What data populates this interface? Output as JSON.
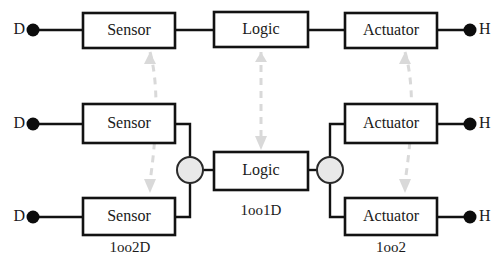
{
  "diagram": {
    "canvas": {
      "width": 503,
      "height": 275
    },
    "colors": {
      "box_stroke": "#121212",
      "box_fill": "#ffffff",
      "wire": "#121212",
      "terminal_dot": "#0c0c0c",
      "junction_fill": "#e8e8e8",
      "junction_stroke": "#2b2b2b",
      "ghost_arrow": "#d9d9d9",
      "text": "#1a1a1a",
      "background": "#ffffff"
    },
    "rows": [
      {
        "name": "top-chain",
        "blocks": [
          {
            "id": "sensor-top",
            "label": "Sensor",
            "x": 83,
            "y": 13,
            "w": 92,
            "h": 35
          },
          {
            "id": "logic-top",
            "label": "Logic",
            "x": 214,
            "y": 12,
            "w": 94,
            "h": 35
          },
          {
            "id": "actuator-top",
            "label": "Actuator",
            "x": 345,
            "y": 13,
            "w": 92,
            "h": 35
          }
        ],
        "terminals": [
          {
            "id": "terminal-d-top",
            "label": "D",
            "side": "left",
            "dot_x": 33,
            "dot_y": 30,
            "text_x": 24,
            "text_y": 30
          },
          {
            "id": "terminal-h-top",
            "label": "H",
            "side": "right",
            "dot_x": 470,
            "dot_y": 30,
            "text_x": 479,
            "text_y": 30
          }
        ]
      },
      {
        "name": "redundant-chain",
        "blocks": [
          {
            "id": "sensor-mid",
            "label": "Sensor",
            "x": 83,
            "y": 104,
            "w": 92,
            "h": 39
          },
          {
            "id": "sensor-bottom",
            "label": "Sensor",
            "x": 83,
            "y": 198,
            "w": 92,
            "h": 37
          },
          {
            "id": "logic-mid",
            "label": "Logic",
            "x": 214,
            "y": 152,
            "w": 94,
            "h": 38
          },
          {
            "id": "actuator-mid",
            "label": "Actuator",
            "x": 345,
            "y": 104,
            "w": 92,
            "h": 39
          },
          {
            "id": "actuator-bottom",
            "label": "Actuator",
            "x": 345,
            "y": 198,
            "w": 92,
            "h": 37
          }
        ],
        "terminals": [
          {
            "id": "terminal-d-mid",
            "label": "D",
            "side": "left",
            "dot_x": 33,
            "dot_y": 124,
            "text_x": 24,
            "text_y": 124
          },
          {
            "id": "terminal-d-bottom",
            "label": "D",
            "side": "left",
            "dot_x": 33,
            "dot_y": 217,
            "text_x": 24,
            "text_y": 217
          },
          {
            "id": "terminal-h-mid",
            "label": "H",
            "side": "right",
            "dot_x": 470,
            "dot_y": 124,
            "text_x": 479,
            "text_y": 124
          },
          {
            "id": "terminal-h-bottom",
            "label": "H",
            "side": "right",
            "dot_x": 470,
            "dot_y": 217,
            "text_x": 479,
            "text_y": 217
          }
        ],
        "junctions": [
          {
            "id": "junction-left",
            "cx": 190,
            "cy": 170,
            "r": 13
          },
          {
            "id": "junction-right",
            "cx": 330,
            "cy": 170,
            "r": 13
          }
        ]
      }
    ],
    "architecture_labels": [
      {
        "id": "label-1oo2d",
        "text": "1oo2D",
        "x": 130,
        "y": 249
      },
      {
        "id": "label-1oo1d",
        "text": "1oo1D",
        "x": 261,
        "y": 212
      },
      {
        "id": "label-1oo2",
        "text": "1oo2",
        "x": 391,
        "y": 249
      }
    ],
    "ghost_arrows": [
      {
        "id": "ghost-arrow-sensor",
        "x1": 150,
        "y1": 52,
        "x2": 162,
        "y2": 96,
        "x3": 150,
        "y3": 185,
        "head_x": 150,
        "head_y": 190
      },
      {
        "id": "ghost-arrow-logic",
        "x1": 261,
        "y1": 52,
        "x2": 261,
        "y2": 100,
        "x3": 261,
        "y3": 142,
        "head_x": 261,
        "head_y": 147
      },
      {
        "id": "ghost-arrow-actuator",
        "x1": 405,
        "y1": 52,
        "x2": 418,
        "y2": 96,
        "x3": 405,
        "y3": 185,
        "head_x": 405,
        "head_y": 190
      }
    ]
  }
}
